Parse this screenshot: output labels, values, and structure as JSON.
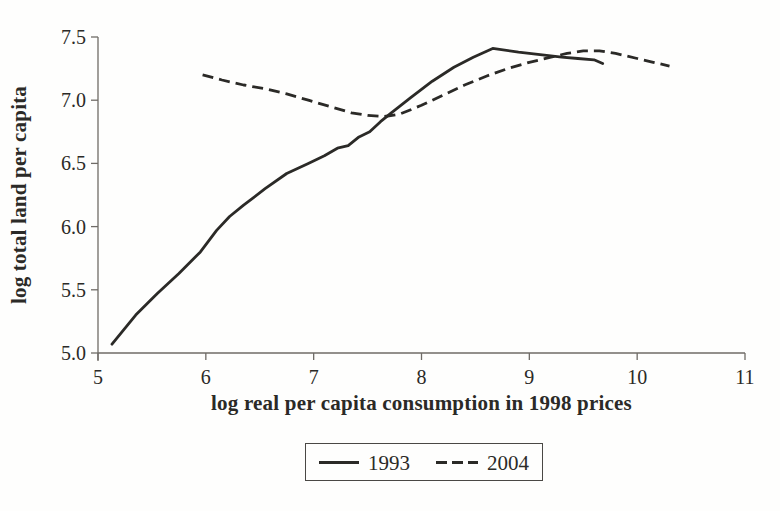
{
  "figure": {
    "background": "#fefefd",
    "ink_color": "#2b2a27",
    "axis_color": "#6f6b66"
  },
  "legend": {
    "items": [
      {
        "label": "1993",
        "style": "solid"
      },
      {
        "label": "2004",
        "style": "dashed"
      }
    ]
  },
  "chart_data": {
    "type": "line",
    "title": "",
    "xlabel": "log real per capita consumption in 1998 prices",
    "ylabel": "log total land per capita",
    "xlim": [
      5,
      11
    ],
    "ylim": [
      5.0,
      7.5
    ],
    "x_ticks": [
      5,
      6,
      7,
      8,
      9,
      10,
      11
    ],
    "x_tick_labels": [
      "5",
      "6",
      "7",
      "8",
      "9",
      "10",
      "11"
    ],
    "y_ticks": [
      5.0,
      5.5,
      6.0,
      6.5,
      7.0,
      7.5
    ],
    "y_tick_labels": [
      "5.0",
      "5.5",
      "6.0",
      "6.5",
      "7.0",
      "7.5"
    ],
    "grid": false,
    "legend_position": "bottom-center",
    "series": [
      {
        "name": "1993",
        "style": "solid",
        "points": [
          [
            5.13,
            5.07
          ],
          [
            5.35,
            5.3
          ],
          [
            5.55,
            5.47
          ],
          [
            5.75,
            5.63
          ],
          [
            5.95,
            5.8
          ],
          [
            6.1,
            5.97
          ],
          [
            6.22,
            6.08
          ],
          [
            6.35,
            6.17
          ],
          [
            6.55,
            6.3
          ],
          [
            6.75,
            6.42
          ],
          [
            6.95,
            6.5
          ],
          [
            7.1,
            6.56
          ],
          [
            7.22,
            6.62
          ],
          [
            7.32,
            6.64
          ],
          [
            7.42,
            6.71
          ],
          [
            7.52,
            6.75
          ],
          [
            7.62,
            6.83
          ],
          [
            7.72,
            6.9
          ],
          [
            7.9,
            7.02
          ],
          [
            8.1,
            7.15
          ],
          [
            8.3,
            7.26
          ],
          [
            8.48,
            7.34
          ],
          [
            8.66,
            7.41
          ],
          [
            8.9,
            7.38
          ],
          [
            9.1,
            7.36
          ],
          [
            9.3,
            7.34
          ],
          [
            9.45,
            7.33
          ],
          [
            9.6,
            7.32
          ],
          [
            9.68,
            7.29
          ]
        ]
      },
      {
        "name": "2004",
        "style": "dashed",
        "points": [
          [
            5.97,
            7.2
          ],
          [
            6.15,
            7.16
          ],
          [
            6.35,
            7.12
          ],
          [
            6.55,
            7.09
          ],
          [
            6.75,
            7.05
          ],
          [
            6.95,
            7.0
          ],
          [
            7.15,
            6.95
          ],
          [
            7.35,
            6.9
          ],
          [
            7.5,
            6.88
          ],
          [
            7.65,
            6.87
          ],
          [
            7.8,
            6.89
          ],
          [
            8.0,
            6.96
          ],
          [
            8.2,
            7.04
          ],
          [
            8.4,
            7.12
          ],
          [
            8.6,
            7.19
          ],
          [
            8.8,
            7.25
          ],
          [
            9.0,
            7.3
          ],
          [
            9.2,
            7.34
          ],
          [
            9.35,
            7.37
          ],
          [
            9.5,
            7.39
          ],
          [
            9.65,
            7.39
          ],
          [
            9.8,
            7.37
          ],
          [
            10.0,
            7.33
          ],
          [
            10.15,
            7.3
          ],
          [
            10.3,
            7.27
          ]
        ]
      }
    ]
  }
}
